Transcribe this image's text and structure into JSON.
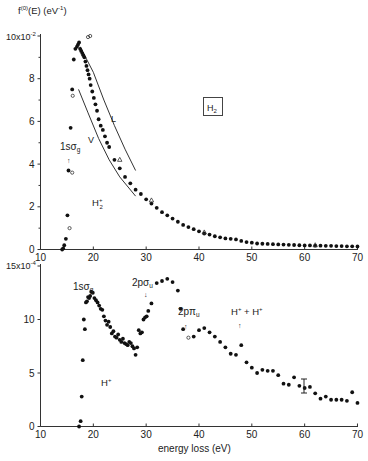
{
  "chart_data": [
    {
      "type": "scatter",
      "title": "H2",
      "ylabel": "f(0)(E) (eV-1)",
      "y_multiplier_label": "10x10-2",
      "xlabel": "",
      "xlim": [
        10,
        70
      ],
      "ylim": [
        0,
        10
      ],
      "x_ticks": [
        10,
        20,
        30,
        40,
        50,
        60,
        70
      ],
      "y_ticks": [
        0,
        2,
        4,
        6,
        8,
        10
      ],
      "y_tick_labels": [
        "0",
        "2",
        "4",
        "6",
        "8",
        "10x10-2"
      ],
      "annotations": [
        "1sσg",
        "H2+",
        "L",
        "V",
        "H2"
      ],
      "series": [
        {
          "name": "filled circles",
          "marker": "filled-circle",
          "x": [
            14.1,
            14.3,
            14.5,
            14.8,
            15.1,
            15.3,
            15.7,
            16.0,
            16.3,
            16.6,
            16.9,
            17.1,
            17.3,
            17.5,
            17.7,
            17.9,
            18.1,
            18.3,
            18.5,
            18.7,
            18.9,
            19.1,
            19.3,
            19.5,
            19.8,
            20.1,
            20.4,
            20.7,
            21.0,
            21.4,
            21.8,
            22.2,
            22.6,
            23.0,
            24.0,
            25.0,
            26.0,
            27.0,
            28.0,
            29.0,
            30.0,
            31.0,
            32.0,
            33.0,
            34.0,
            35.0,
            36.0,
            37.0,
            38.0,
            39.0,
            40.0,
            41.0,
            42.0,
            43.0,
            44.0,
            45.0,
            46.0,
            47.0,
            48.0,
            49.0,
            50.0,
            51.0,
            52.0,
            53.0,
            54.0,
            55.0,
            56.0,
            57.0,
            58.0,
            59.0,
            60.0,
            61.0,
            62.0,
            63.0,
            64.0,
            65.0,
            66.0,
            67.0,
            68.0,
            69.0,
            70.0
          ],
          "y": [
            0.0,
            0.05,
            0.2,
            0.5,
            1.6,
            3.7,
            5.7,
            7.5,
            8.9,
            9.4,
            9.5,
            9.6,
            9.7,
            9.4,
            9.3,
            9.2,
            9.1,
            9.0,
            8.8,
            8.6,
            8.4,
            8.2,
            8.0,
            7.7,
            7.4,
            7.1,
            6.8,
            6.5,
            6.1,
            5.8,
            5.6,
            5.3,
            5.0,
            4.8,
            4.2,
            3.8,
            3.4,
            3.1,
            2.8,
            2.6,
            2.35,
            2.15,
            1.95,
            1.75,
            1.6,
            1.45,
            1.3,
            1.15,
            1.05,
            0.95,
            0.85,
            0.75,
            0.7,
            0.62,
            0.57,
            0.52,
            0.5,
            0.47,
            0.4,
            0.35,
            0.32,
            0.28,
            0.27,
            0.26,
            0.25,
            0.24,
            0.23,
            0.22,
            0.21,
            0.2,
            0.19,
            0.19,
            0.18,
            0.18,
            0.17,
            0.17,
            0.16,
            0.16,
            0.15,
            0.15,
            0.14
          ]
        },
        {
          "name": "open circles",
          "marker": "open-circle",
          "x": [
            15.5,
            16.0,
            16.1,
            19.0,
            19.4
          ],
          "y": [
            1.0,
            3.6,
            7.2,
            9.95,
            10.0
          ]
        },
        {
          "name": "triangles",
          "marker": "triangle",
          "x": [
            25.0,
            31.0,
            41.0,
            62.0
          ],
          "y": [
            4.2,
            2.3,
            0.8,
            0.2
          ]
        },
        {
          "name": "L",
          "type": "line",
          "x": [
            17.5,
            20,
            22,
            24,
            26,
            28
          ],
          "y": [
            9.5,
            8.3,
            7.0,
            5.8,
            4.7,
            3.7
          ]
        },
        {
          "name": "V",
          "type": "line",
          "x": [
            17.2,
            19,
            21,
            23,
            25,
            28
          ],
          "y": [
            7.5,
            6.4,
            5.2,
            4.2,
            3.4,
            2.5
          ]
        }
      ]
    },
    {
      "type": "scatter",
      "title": "",
      "xlabel": "energy loss (eV)",
      "ylabel": "",
      "y_multiplier_label": "15x10-4",
      "xlim": [
        10,
        70
      ],
      "ylim": [
        0,
        15
      ],
      "x_ticks": [
        10,
        20,
        30,
        40,
        50,
        60,
        70
      ],
      "y_ticks": [
        0,
        5,
        10,
        15
      ],
      "y_tick_labels": [
        "0",
        "5",
        "10",
        "15x10-4"
      ],
      "annotations": [
        "1sσg",
        "2pσu",
        "2pπu",
        "H+ + H+",
        "H+"
      ],
      "series": [
        {
          "name": "filled circles",
          "marker": "filled-circle",
          "x": [
            17.3,
            17.6,
            17.8,
            18.0,
            18.2,
            18.4,
            18.6,
            18.8,
            19.0,
            19.2,
            19.4,
            19.6,
            19.9,
            20.2,
            20.5,
            20.8,
            21.1,
            21.4,
            21.7,
            22.0,
            22.3,
            22.6,
            22.9,
            23.2,
            23.5,
            23.8,
            24.1,
            24.4,
            24.7,
            25.0,
            25.3,
            25.6,
            25.9,
            26.2,
            26.5,
            26.8,
            27.1,
            27.4,
            27.7,
            28.0,
            28.3,
            28.6,
            28.9,
            29.2,
            29.5,
            29.8,
            30.1,
            30.4,
            31.0,
            32.0,
            33.0,
            34.0,
            35.0,
            36.0,
            36.5,
            37.0,
            39.0,
            40.0,
            41.0,
            42.0,
            43.0,
            44.0,
            45.0,
            46.0,
            47.0,
            48.0,
            49.0,
            50.0,
            51.0,
            52.0,
            53.0,
            54.0,
            55.0,
            56.0,
            57.0,
            58.0,
            59.0,
            60.0,
            61.0,
            62.0,
            63.0,
            64.0,
            65.0,
            66.0,
            67.0,
            68.0,
            69.0,
            70.0
          ],
          "y": [
            0.0,
            0.5,
            2.8,
            6.2,
            10.0,
            9.1,
            11.6,
            11.7,
            12.1,
            12.0,
            12.2,
            12.6,
            12.5,
            12.0,
            11.8,
            11.6,
            11.3,
            11.0,
            10.9,
            10.3,
            9.9,
            9.5,
            9.8,
            9.3,
            8.7,
            8.9,
            8.4,
            8.3,
            8.6,
            8.1,
            7.9,
            8.2,
            7.8,
            7.7,
            7.6,
            7.9,
            7.8,
            7.5,
            7.3,
            6.7,
            7.4,
            9.0,
            8.7,
            8.8,
            10.0,
            10.2,
            10.3,
            10.8,
            11.5,
            13.4,
            13.6,
            13.8,
            13.5,
            12.7,
            11.0,
            9.1,
            8.4,
            9.0,
            9.2,
            8.8,
            8.4,
            7.9,
            7.4,
            6.8,
            6.7,
            7.6,
            6.0,
            5.5,
            5.0,
            5.3,
            5.2,
            5.2,
            4.8,
            4.0,
            3.9,
            4.6,
            3.8,
            3.6,
            3.7,
            3.1,
            2.6,
            2.8,
            2.5,
            2.5,
            2.5,
            2.4,
            3.2,
            2.2
          ]
        },
        {
          "name": "open circles",
          "marker": "open-circle",
          "x": [
            38.0
          ],
          "y": [
            8.3
          ]
        }
      ]
    }
  ],
  "labels": {
    "top_ylabel": "f(0)(E) (eV-1)",
    "top_ymult": "10x10",
    "top_ymult_exp": "-2",
    "bottom_ymult": "15x10",
    "bottom_ymult_exp": "-4",
    "xlabel": "energy loss (eV)",
    "h2_box": "H",
    "h2_box_sub": "2",
    "top_1s": "1sσ",
    "top_1s_sub": "g",
    "top_ion": "H",
    "top_ion_sup": "+",
    "top_ion_sub": "2",
    "curve_L": "L",
    "curve_V": "V",
    "bot_1s": "1sσ",
    "bot_1s_sub": "g",
    "bot_2psig": "2pσ",
    "bot_2psig_sub": "u",
    "bot_2ppi": "2pπ",
    "bot_2ppi_sub": "u",
    "bot_hh": "H",
    "bot_hh_mid": " + H",
    "bot_hplus": "H",
    "plus": "+"
  }
}
